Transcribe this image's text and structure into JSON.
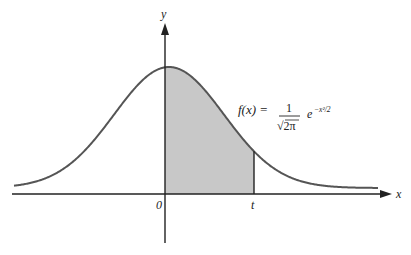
{
  "diagram": {
    "type": "standard normal density with shaded area",
    "axes": {
      "x_label": "x",
      "y_label": "y",
      "origin_label": "0",
      "t_label": "t"
    },
    "formula": {
      "lhs": "f(x) =",
      "numerator": "1",
      "denominator": "√2π",
      "exp_base": "e",
      "exponent": "−x²/2"
    },
    "shaded_region": {
      "from": "0",
      "to": "t",
      "color": "#c8c8c8"
    },
    "colors": {
      "curve": "#555555",
      "axes": "#222222",
      "shade": "#c8c8c8"
    }
  }
}
